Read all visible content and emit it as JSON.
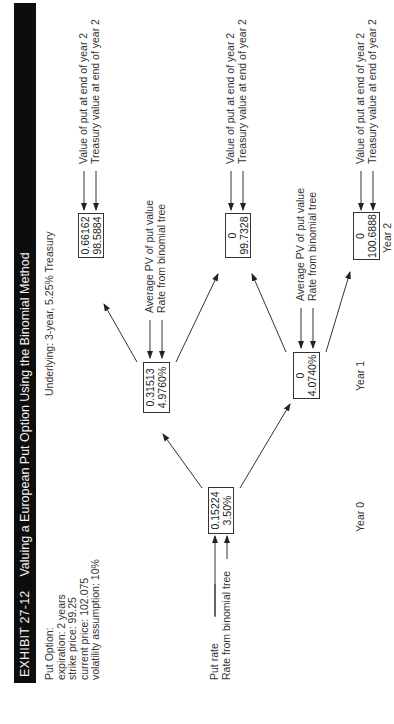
{
  "exhibit": {
    "number": "EXHIBIT 27-12",
    "title": "Valuing a European Put Option Using the Binomial Method"
  },
  "put_option": {
    "heading": "Put Option:",
    "expiration": "expiration: 2 years",
    "strike_price": "strike price: 99.25",
    "current_price": "current price: 102.075",
    "volatility": "volatility assumption: 10%"
  },
  "underlying": "Underlying: 3-year, 5.25% Treasury",
  "legend": {
    "year0": {
      "line1": "Put rate",
      "line2": "Rate from binomial tree"
    },
    "year1_top": {
      "line1": "Average PV of put value",
      "line2": "Rate from binomial tree"
    },
    "year1_bottom": {
      "line1": "Average PV of put value",
      "line2": "Rate from binomial tree"
    },
    "year2_top": {
      "line1": "Value of put at end of year 2",
      "line2": "Treasury value at end of year 2"
    },
    "year2_middle": {
      "line1": "Value of put at end of year 2",
      "line2": "Treasury value at end of year 2"
    },
    "year2_bottom": {
      "line1": "Value of put at end of year 2",
      "line2": "Treasury value at end of year 2"
    }
  },
  "nodes": {
    "year0": {
      "value": "0.15224",
      "rate": "3.50%"
    },
    "year1_up": {
      "value": "0.31513",
      "rate": "4.9760%"
    },
    "year1_down": {
      "value": "0",
      "rate": "4.0740%"
    },
    "year2_uu": {
      "value": "0.66162",
      "price": "98.5884"
    },
    "year2_ud": {
      "value": "0",
      "price": "99.7328"
    },
    "year2_dd": {
      "value": "0",
      "price": "100.6888"
    }
  },
  "axis": {
    "year0": "Year 0",
    "year1": "Year 1",
    "year2": "Year 2"
  }
}
